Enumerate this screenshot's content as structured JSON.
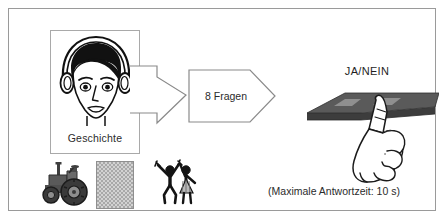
{
  "figure": {
    "frame": {
      "border_color": "#9a9a9a",
      "background": "#ffffff"
    },
    "listener": {
      "box_label": "Geschichte",
      "icon_name": "head-with-headphones-icon",
      "box_border_color": "#a9a9a9"
    },
    "flow": {
      "arrow_icon_name": "block-arrow-right-icon",
      "arrow_fill": "#ffffff",
      "arrow_stroke": "#8a8a8a"
    },
    "questions": {
      "label": "8 Fragen",
      "count": 8,
      "shape_stroke": "#8a8a8a",
      "shape_fill": "#ffffff"
    },
    "response": {
      "label": "JA/NEIN",
      "device_icon_name": "tablet-device-icon",
      "hand_icon_name": "pointing-hand-icon",
      "device_color": "#4f4f4f",
      "device_button_color": "#8d8d8d"
    },
    "stimuli": [
      {
        "icon_name": "tractor-icon"
      },
      {
        "icon_name": "texture-patch-icon"
      },
      {
        "icon_name": "dancing-figures-icon"
      }
    ],
    "caption": {
      "text": "(Maximale Antwortzeit: 10 s)",
      "max_response_time_seconds": 10
    }
  }
}
